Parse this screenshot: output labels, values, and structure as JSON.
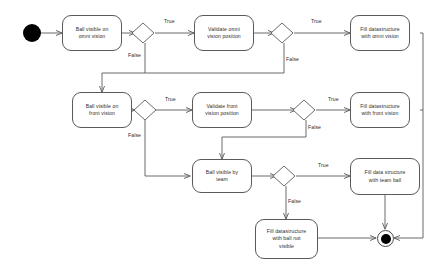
{
  "diagram": {
    "type": "uml-activity-diagram",
    "nodes": {
      "start": {
        "kind": "initial-node",
        "label": ""
      },
      "ball_visible_omni": {
        "kind": "activity",
        "lines": [
          "Ball visible on",
          "omni vision"
        ]
      },
      "validate_omni": {
        "kind": "activity",
        "lines": [
          "Validate omni",
          "vision position"
        ]
      },
      "fill_omni": {
        "kind": "activity",
        "lines": [
          "Fill datastructure",
          "with omni vision"
        ]
      },
      "ball_visible_front": {
        "kind": "activity",
        "lines": [
          "Ball visible on",
          "front vision"
        ]
      },
      "validate_front": {
        "kind": "activity",
        "lines": [
          "Validate front",
          "vision position"
        ]
      },
      "fill_front": {
        "kind": "activity",
        "lines": [
          "Fill datastructure",
          "with front vision"
        ]
      },
      "ball_visible_team": {
        "kind": "activity",
        "lines": [
          "Ball visible by",
          "team"
        ]
      },
      "fill_team": {
        "kind": "activity",
        "lines": [
          "Fill data structure",
          "with team ball"
        ]
      },
      "fill_not_visible": {
        "kind": "activity",
        "lines": [
          "Fill datastructure",
          "with ball not",
          "visible"
        ]
      },
      "end": {
        "kind": "final-node",
        "label": ""
      },
      "decision_1": {
        "kind": "decision"
      },
      "decision_2": {
        "kind": "decision"
      },
      "decision_3": {
        "kind": "decision"
      },
      "decision_4": {
        "kind": "decision"
      },
      "decision_5": {
        "kind": "decision"
      }
    },
    "edge_labels": {
      "d1_true": "True",
      "d1_false": "False",
      "d2_true": "True",
      "d2_false": "False",
      "d3_true": "True",
      "d3_false": "False",
      "d4_true": "True",
      "d4_false": "False",
      "d5_true": "True",
      "d5_false": "False"
    },
    "colors": {
      "stroke": "#5a5a5a",
      "text": "#2b2b2b",
      "fill": "#ffffff",
      "node_fill": "#000000"
    }
  }
}
